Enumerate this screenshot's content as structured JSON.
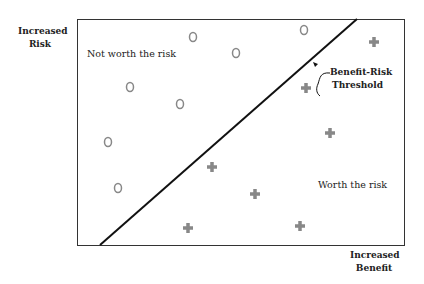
{
  "axes": {
    "y_label_line1": "Increased",
    "y_label_line2": "Risk",
    "x_label_line1": "Increased",
    "x_label_line2": "Benefit"
  },
  "regions": {
    "upper_left": "Not worth the risk",
    "lower_right": "Worth the risk"
  },
  "threshold": {
    "label_line1": "Benefit-Risk",
    "label_line2": "Threshold"
  },
  "colors": {
    "marker": "#888888",
    "line": "#111111"
  },
  "chart_data": {
    "type": "scatter",
    "title": "",
    "xlabel": "Increased Benefit",
    "ylabel": "Increased Risk",
    "series": [
      {
        "name": "Not worth the risk",
        "marker": "circle",
        "points": [
          [
            193,
            37
          ],
          [
            236,
            53
          ],
          [
            304,
            30
          ],
          [
            130,
            87
          ],
          [
            180,
            104
          ],
          [
            108,
            142
          ],
          [
            118,
            188
          ]
        ]
      },
      {
        "name": "Worth the risk",
        "marker": "plus",
        "points": [
          [
            374,
            42
          ],
          [
            306,
            88
          ],
          [
            330,
            133
          ],
          [
            212,
            167
          ],
          [
            255,
            194
          ],
          [
            188,
            228
          ],
          [
            300,
            226
          ]
        ]
      }
    ],
    "threshold_line": [
      [
        100,
        245
      ],
      [
        357,
        18
      ]
    ],
    "grid": false
  }
}
